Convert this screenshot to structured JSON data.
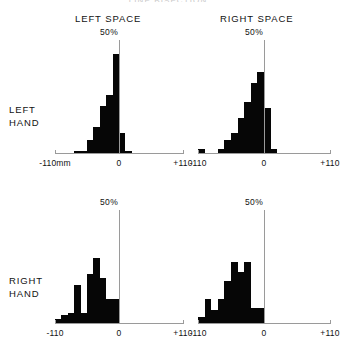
{
  "figure": {
    "title": "LINE BISECTION",
    "column_headings": [
      {
        "id": "left-space",
        "label": "LEFT  SPACE"
      },
      {
        "id": "right-space",
        "label": "RIGHT SPACE"
      }
    ],
    "row_labels": [
      {
        "id": "left-hand",
        "line1": "LEFT",
        "line2": "HAND"
      },
      {
        "id": "right-hand",
        "line1": "RIGHT",
        "line2": "HAND"
      }
    ],
    "axis_colors": {
      "axis": "#9a9a9a",
      "bar": "#060606"
    }
  },
  "chart_data": [
    {
      "id": "left-hand-left-space",
      "type": "bar",
      "title": "LEFT HAND / LEFT SPACE",
      "xlabel": "",
      "ylabel": "50%",
      "xlim": [
        -110,
        110
      ],
      "ylim": [
        0,
        50
      ],
      "grid": false,
      "legend": "none",
      "xtick_labels": [
        "-110mm",
        "0",
        "+110"
      ],
      "xtick_values": [
        -110,
        0,
        110
      ],
      "ytick_labels": [
        "50%"
      ],
      "bin_width": 11,
      "bin_centers": [
        -71.5,
        -60.5,
        -49.5,
        -38.5,
        -27.5,
        -16.5,
        -5.5,
        5.5,
        16.5
      ],
      "values": [
        1.5,
        1.5,
        6,
        12,
        21,
        26,
        44,
        9,
        1.5
      ]
    },
    {
      "id": "left-hand-right-space",
      "type": "bar",
      "title": "LEFT HAND / RIGHT SPACE",
      "xlabel": "",
      "ylabel": "50%",
      "xlim": [
        -110,
        110
      ],
      "ylim": [
        0,
        50
      ],
      "grid": false,
      "legend": "none",
      "xtick_labels": [
        "-110",
        "0",
        "+110"
      ],
      "xtick_values": [
        -110,
        0,
        110
      ],
      "ytick_labels": [
        "50%"
      ],
      "bin_width": 11,
      "bin_centers": [
        -104.5,
        -71.5,
        -60.5,
        -49.5,
        -38.5,
        -27.5,
        -16.5,
        -5.5,
        5.5,
        16.5
      ],
      "values": [
        2,
        2,
        6,
        9,
        16,
        23,
        31,
        36,
        20,
        2
      ]
    },
    {
      "id": "right-hand-left-space",
      "type": "bar",
      "title": "RIGHT HAND / LEFT SPACE",
      "xlabel": "",
      "ylabel": "50%",
      "xlim": [
        -110,
        110
      ],
      "ylim": [
        0,
        50
      ],
      "grid": false,
      "legend": "none",
      "xtick_labels": [
        "-110",
        "0",
        "+110"
      ],
      "xtick_values": [
        -110,
        0,
        110
      ],
      "ytick_labels": [
        "50%"
      ],
      "bin_width": 11,
      "bin_centers": [
        -104.5,
        -93.5,
        -82.5,
        -71.5,
        -60.5,
        -49.5,
        -38.5,
        -27.5,
        -16.5,
        -5.5
      ],
      "values": [
        2,
        4,
        5,
        17,
        5,
        22,
        29,
        20,
        11,
        11
      ]
    },
    {
      "id": "right-hand-right-space",
      "type": "bar",
      "title": "RIGHT HAND / RIGHT SPACE",
      "xlabel": "",
      "ylabel": "50%",
      "xlim": [
        -110,
        110
      ],
      "ylim": [
        0,
        50
      ],
      "grid": false,
      "legend": "none",
      "xtick_labels": [
        "-110",
        "0",
        "+110"
      ],
      "xtick_values": [
        -110,
        0,
        110
      ],
      "ytick_labels": [
        "50%"
      ],
      "bin_width": 11,
      "bin_centers": [
        -104.5,
        -93.5,
        -82.5,
        -71.5,
        -60.5,
        -49.5,
        -38.5,
        -27.5,
        -16.5,
        -5.5
      ],
      "values": [
        3,
        11,
        6,
        11,
        19,
        27,
        23,
        27,
        7,
        7
      ]
    }
  ]
}
